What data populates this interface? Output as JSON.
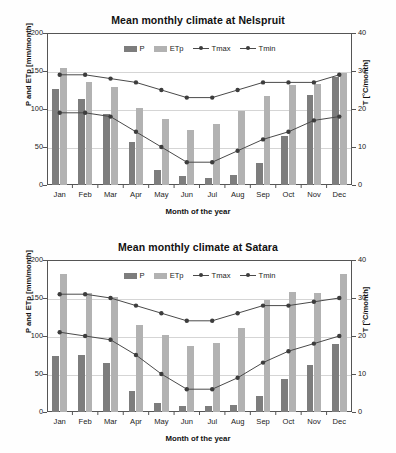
{
  "page": {
    "background": "#fefefe"
  },
  "colors": {
    "bar_p": "#7d7d7d",
    "bar_etp": "#b2b2b2",
    "line_tmax": "#4a4a4a",
    "line_tmin": "#4a4a4a",
    "marker": "#3d3d3d",
    "grid": "#d5d5d5",
    "axis": "#555555"
  },
  "common": {
    "xlabel": "Month of the year",
    "ylabel_left": "P and ETp  [mm/month]",
    "ylabel_right": "T [°C/month]",
    "months": [
      "Jan",
      "Feb",
      "Mar",
      "Apr",
      "May",
      "Jun",
      "Jul",
      "Aug",
      "Sep",
      "Oct",
      "Nov",
      "Dec"
    ],
    "left_ticks": [
      "0",
      "50",
      "100",
      "150",
      "200"
    ],
    "right_ticks": [
      "0",
      "10",
      "20",
      "30",
      "40"
    ],
    "legend": [
      {
        "key": "P",
        "label": "P",
        "type": "bar"
      },
      {
        "key": "ETp",
        "label": "ETp",
        "type": "bar"
      },
      {
        "key": "Tmax",
        "label": "Tmax",
        "type": "line"
      },
      {
        "key": "Tmin",
        "label": "Tmin",
        "type": "line"
      }
    ]
  },
  "chart_data": [
    {
      "id": "nelspruit",
      "type": "bar",
      "title": "Mean monthly climate at Nelspruit",
      "xlabel": "Month of the year",
      "ylabel": "P and ETp  [mm/month]",
      "ylabel_secondary": "T [°C/month]",
      "categories": [
        "Jan",
        "Feb",
        "Mar",
        "Apr",
        "May",
        "Jun",
        "Jul",
        "Aug",
        "Sep",
        "Oct",
        "Nov",
        "Dec"
      ],
      "ylim": [
        0,
        200
      ],
      "ylim_secondary": [
        0,
        40
      ],
      "yticks": [
        0,
        50,
        100,
        150,
        200
      ],
      "yticks_secondary": [
        0,
        10,
        20,
        30,
        40
      ],
      "grid": true,
      "legend_position": "top-center",
      "series": [
        {
          "name": "P",
          "type": "bar",
          "axis": "left",
          "unit": "mm/month",
          "values": [
            126,
            113,
            93,
            57,
            20,
            12,
            9,
            13,
            29,
            64,
            118,
            142
          ]
        },
        {
          "name": "ETp",
          "type": "bar",
          "axis": "left",
          "unit": "mm/month",
          "values": [
            154,
            135,
            129,
            101,
            87,
            72,
            80,
            98,
            117,
            132,
            133,
            147
          ]
        },
        {
          "name": "Tmax",
          "type": "line",
          "axis": "right",
          "unit": "°C",
          "values": [
            29,
            29,
            28,
            27,
            25,
            23,
            23,
            25,
            27,
            27,
            27,
            29
          ]
        },
        {
          "name": "Tmin",
          "type": "line",
          "axis": "right",
          "unit": "°C",
          "values": [
            19,
            19,
            18,
            14,
            10,
            6,
            6,
            9,
            12,
            14,
            17,
            18
          ]
        }
      ]
    },
    {
      "id": "satara",
      "type": "bar",
      "title": "Mean monthly climate at Satara",
      "xlabel": "Month of the year",
      "ylabel": "P and ETp  [mm/month]",
      "ylabel_secondary": "T [°C/month]",
      "categories": [
        "Jan",
        "Feb",
        "Mar",
        "Apr",
        "May",
        "Jun",
        "Jul",
        "Aug",
        "Sep",
        "Oct",
        "Nov",
        "Dec"
      ],
      "ylim": [
        0,
        200
      ],
      "ylim_secondary": [
        0,
        40
      ],
      "yticks": [
        0,
        50,
        100,
        150,
        200
      ],
      "yticks_secondary": [
        0,
        10,
        20,
        30,
        40
      ],
      "grid": true,
      "legend_position": "top-center",
      "series": [
        {
          "name": "P",
          "type": "bar",
          "axis": "left",
          "unit": "mm/month",
          "values": [
            74,
            75,
            64,
            27,
            12,
            8,
            8,
            9,
            21,
            43,
            62,
            89
          ]
        },
        {
          "name": "ETp",
          "type": "bar",
          "axis": "left",
          "unit": "mm/month",
          "values": [
            181,
            156,
            151,
            115,
            101,
            87,
            91,
            111,
            147,
            158,
            156,
            181
          ]
        },
        {
          "name": "Tmax",
          "type": "line",
          "axis": "right",
          "unit": "°C",
          "values": [
            31,
            31,
            30,
            28,
            26,
            24,
            24,
            26,
            28,
            28,
            29,
            30
          ]
        },
        {
          "name": "Tmin",
          "type": "line",
          "axis": "right",
          "unit": "°C",
          "values": [
            21,
            20,
            19,
            15,
            10,
            6,
            6,
            9,
            13,
            16,
            18,
            20
          ]
        }
      ]
    }
  ]
}
